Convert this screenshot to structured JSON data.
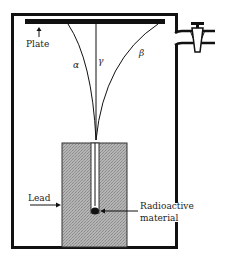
{
  "diagram": {
    "labels": {
      "plate": "Plate",
      "alpha": "α",
      "gamma": "γ",
      "beta": "β",
      "lead": "Lead",
      "radioactive_line1": "Radioactive",
      "radioactive_line2": "material"
    },
    "colors": {
      "line": "#111111",
      "lead_fill": "#a9a9a9",
      "background": "#ffffff"
    }
  }
}
